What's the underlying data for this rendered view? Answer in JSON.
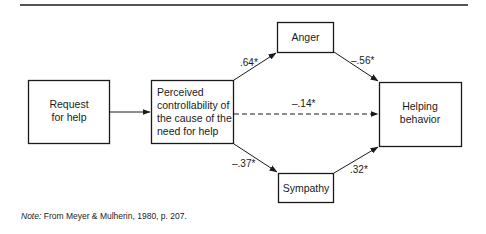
{
  "diagram": {
    "nodes": {
      "request": {
        "lines": [
          "Request",
          "for help"
        ]
      },
      "perceived": {
        "lines": [
          "Perceived",
          "controllability of",
          "the cause of the",
          "need for help"
        ]
      },
      "anger": {
        "lines": [
          "Anger"
        ]
      },
      "sympathy": {
        "lines": [
          "Sympathy"
        ]
      },
      "helping": {
        "lines": [
          "Helping",
          "behavior"
        ]
      }
    },
    "edges": [
      {
        "from": "request",
        "to": "perceived",
        "label": "",
        "style": "solid"
      },
      {
        "from": "perceived",
        "to": "anger",
        "label": ".64*",
        "style": "solid"
      },
      {
        "from": "anger",
        "to": "helping",
        "label": "–.56*",
        "style": "solid"
      },
      {
        "from": "perceived",
        "to": "helping",
        "label": "–.14*",
        "style": "dashed"
      },
      {
        "from": "perceived",
        "to": "sympathy",
        "label": "–.37*",
        "style": "solid"
      },
      {
        "from": "sympathy",
        "to": "helping",
        "label": ".32*",
        "style": "solid"
      }
    ]
  },
  "note": {
    "prefix": "Note:",
    "text": " From Meyer & Mulherin, 1980, p. 207."
  }
}
